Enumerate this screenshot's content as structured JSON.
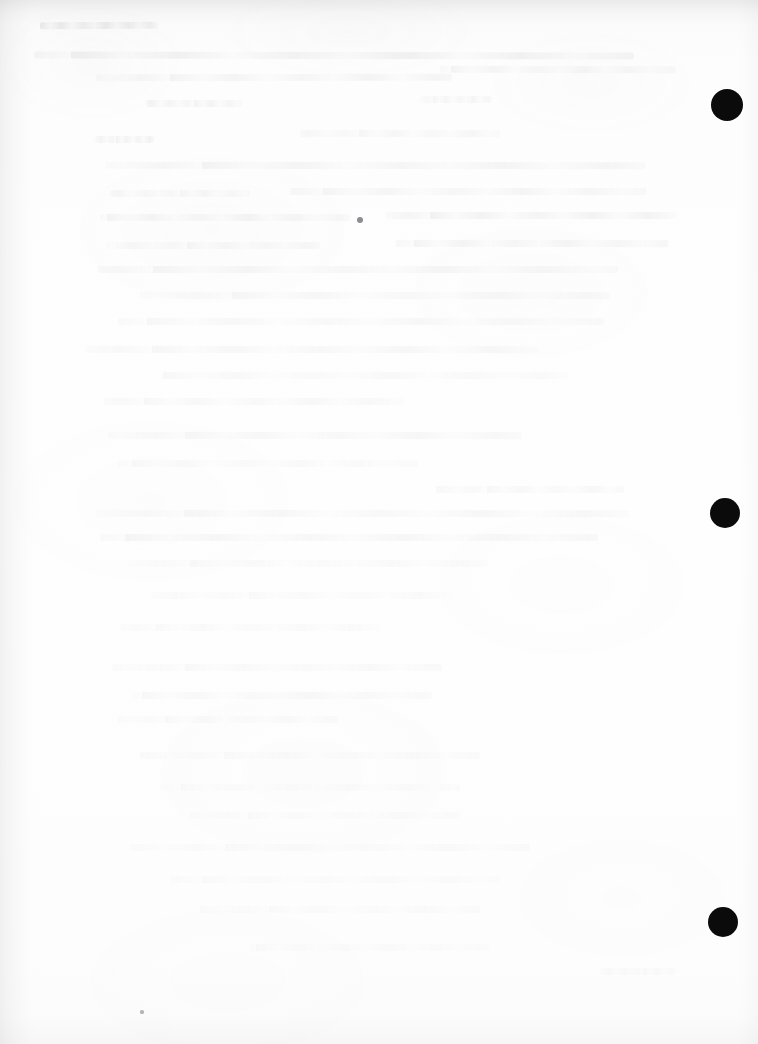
{
  "document": {
    "kind": "scanned-page",
    "page_state": "blank",
    "width_px": 758,
    "height_px": 1044,
    "visible_text": "",
    "notes_visible_on_page": "No legible text is rendered on this page; only faint reverse-side bleed-through is visible."
  },
  "colors": {
    "paper": "#fdfdfd",
    "paper_top_band": "#f3f3f4",
    "mark_black": "#0b0b0b",
    "ghost_gray": "#7878 80",
    "speck_gray": "#8d8d93",
    "edge_shadow": "#8c8c92"
  },
  "marks": {
    "label": "registration-marks",
    "description": "Three solid black filled circles aligned along the right margin",
    "count": 3,
    "items": [
      {
        "id": "mark-1",
        "cx": 727,
        "cy": 105,
        "r": 16
      },
      {
        "id": "mark-2",
        "cx": 725,
        "cy": 513,
        "r": 15
      },
      {
        "id": "mark-3",
        "cx": 723,
        "cy": 922,
        "r": 15
      }
    ]
  },
  "specks": [
    {
      "id": "speck-center",
      "cx": 360,
      "cy": 220,
      "r": 3.0,
      "kind": "main"
    },
    {
      "id": "speck-bottom",
      "cx": 142,
      "cy": 1012,
      "r": 1.6,
      "kind": "tiny"
    }
  ],
  "ghost_lines": [
    {
      "x": 40,
      "y": 22,
      "w": 118,
      "opacity": 0.5,
      "rotate": -0.3
    },
    {
      "x": 34,
      "y": 52,
      "w": 600,
      "opacity": 0.34,
      "rotate": 0.1
    },
    {
      "x": 96,
      "y": 74,
      "w": 356,
      "opacity": 0.26,
      "rotate": -0.1
    },
    {
      "x": 440,
      "y": 66,
      "w": 236,
      "opacity": 0.24,
      "rotate": 0.15
    },
    {
      "x": 146,
      "y": 100,
      "w": 96,
      "opacity": 0.28,
      "rotate": 0.0
    },
    {
      "x": 420,
      "y": 96,
      "w": 72,
      "opacity": 0.22,
      "rotate": 0.0
    },
    {
      "x": 94,
      "y": 136,
      "w": 60,
      "opacity": 0.3,
      "rotate": 0.0
    },
    {
      "x": 300,
      "y": 130,
      "w": 200,
      "opacity": 0.2,
      "rotate": 0.1
    },
    {
      "x": 106,
      "y": 162,
      "w": 540,
      "opacity": 0.26,
      "rotate": 0.05
    },
    {
      "x": 290,
      "y": 188,
      "w": 356,
      "opacity": 0.24,
      "rotate": 0.0
    },
    {
      "x": 110,
      "y": 190,
      "w": 140,
      "opacity": 0.22,
      "rotate": 0.0
    },
    {
      "x": 100,
      "y": 214,
      "w": 250,
      "opacity": 0.26,
      "rotate": 0.05
    },
    {
      "x": 386,
      "y": 212,
      "w": 290,
      "opacity": 0.3,
      "rotate": 0.0
    },
    {
      "x": 106,
      "y": 242,
      "w": 214,
      "opacity": 0.22,
      "rotate": 0.0
    },
    {
      "x": 396,
      "y": 240,
      "w": 272,
      "opacity": 0.26,
      "rotate": 0.05
    },
    {
      "x": 98,
      "y": 266,
      "w": 520,
      "opacity": 0.24,
      "rotate": 0.0
    },
    {
      "x": 140,
      "y": 292,
      "w": 470,
      "opacity": 0.2,
      "rotate": 0.05
    },
    {
      "x": 118,
      "y": 318,
      "w": 486,
      "opacity": 0.18,
      "rotate": 0.0
    },
    {
      "x": 86,
      "y": 346,
      "w": 452,
      "opacity": 0.2,
      "rotate": 0.05
    },
    {
      "x": 160,
      "y": 372,
      "w": 408,
      "opacity": 0.16,
      "rotate": 0.0
    },
    {
      "x": 104,
      "y": 398,
      "w": 300,
      "opacity": 0.18,
      "rotate": 0.0
    },
    {
      "x": 108,
      "y": 432,
      "w": 414,
      "opacity": 0.2,
      "rotate": 0.05
    },
    {
      "x": 118,
      "y": 460,
      "w": 300,
      "opacity": 0.14,
      "rotate": 0.0
    },
    {
      "x": 436,
      "y": 486,
      "w": 188,
      "opacity": 0.18,
      "rotate": 0.0
    },
    {
      "x": 96,
      "y": 510,
      "w": 534,
      "opacity": 0.2,
      "rotate": 0.05
    },
    {
      "x": 100,
      "y": 534,
      "w": 498,
      "opacity": 0.22,
      "rotate": 0.0
    },
    {
      "x": 128,
      "y": 560,
      "w": 360,
      "opacity": 0.14,
      "rotate": 0.0
    },
    {
      "x": 150,
      "y": 592,
      "w": 300,
      "opacity": 0.12,
      "rotate": 0.0
    },
    {
      "x": 120,
      "y": 624,
      "w": 260,
      "opacity": 0.12,
      "rotate": 0.0
    },
    {
      "x": 112,
      "y": 664,
      "w": 330,
      "opacity": 0.14,
      "rotate": 0.0
    },
    {
      "x": 132,
      "y": 692,
      "w": 300,
      "opacity": 0.16,
      "rotate": 0.0
    },
    {
      "x": 118,
      "y": 716,
      "w": 220,
      "opacity": 0.14,
      "rotate": 0.0
    },
    {
      "x": 140,
      "y": 752,
      "w": 340,
      "opacity": 0.12,
      "rotate": 0.0
    },
    {
      "x": 160,
      "y": 784,
      "w": 300,
      "opacity": 0.1,
      "rotate": 0.0
    },
    {
      "x": 190,
      "y": 812,
      "w": 270,
      "opacity": 0.1,
      "rotate": 0.0
    },
    {
      "x": 130,
      "y": 844,
      "w": 400,
      "opacity": 0.12,
      "rotate": 0.0
    },
    {
      "x": 170,
      "y": 876,
      "w": 330,
      "opacity": 0.1,
      "rotate": 0.0
    },
    {
      "x": 200,
      "y": 906,
      "w": 280,
      "opacity": 0.1,
      "rotate": 0.0
    },
    {
      "x": 250,
      "y": 944,
      "w": 240,
      "opacity": 0.1,
      "rotate": 0.0
    },
    {
      "x": 600,
      "y": 968,
      "w": 76,
      "opacity": 0.14,
      "rotate": 0.0
    }
  ]
}
